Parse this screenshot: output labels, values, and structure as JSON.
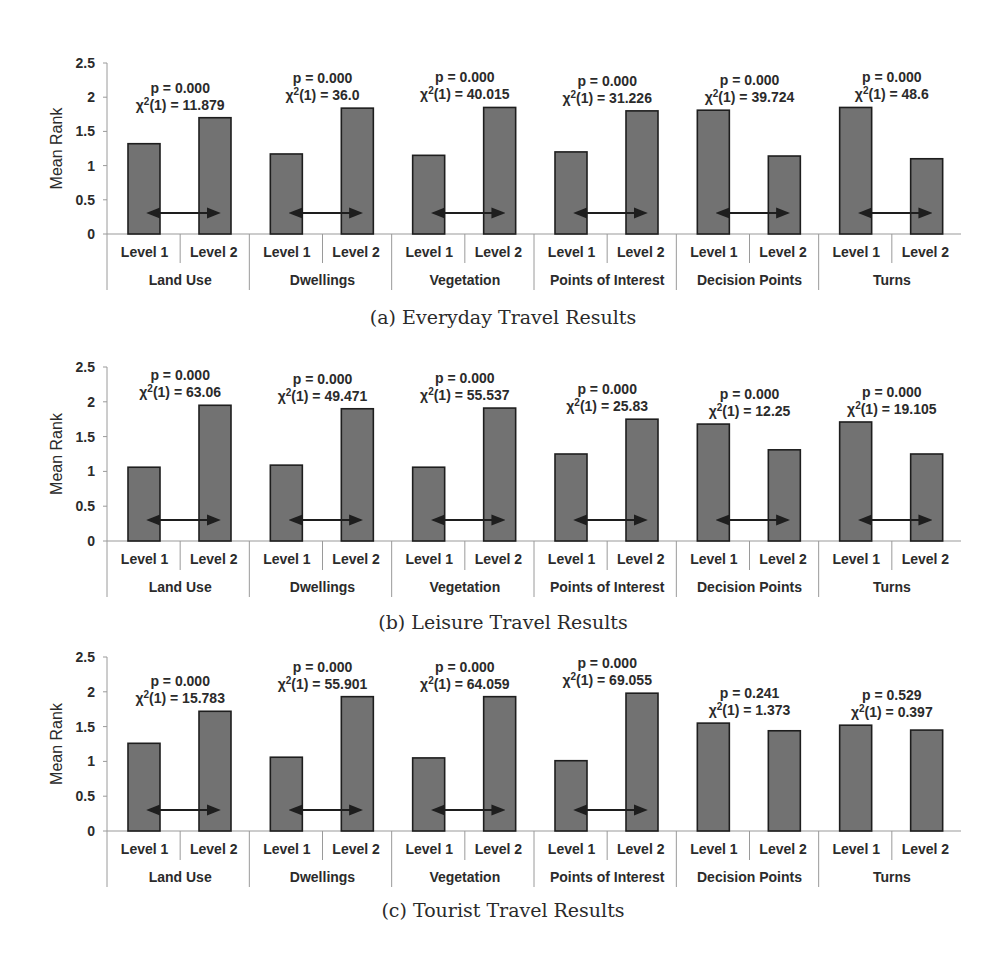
{
  "chart_data": [
    {
      "id": "a",
      "type": "bar",
      "title": "(a) Everyday Travel Results",
      "ylabel": "Mean Rank",
      "ylim": [
        0,
        2.5
      ],
      "yticks": [
        "0",
        "0.5",
        "1",
        "1.5",
        "2",
        "2.5"
      ],
      "grid": false,
      "categories": [
        "Land Use",
        "Dwellings",
        "Vegetation",
        "Points of Interest",
        "Decision Points",
        "Turns"
      ],
      "sub_categories": [
        [
          "Level  1",
          "Level 2"
        ],
        [
          "Level 1",
          "Level 2"
        ],
        [
          "Level 1",
          "Level 2"
        ],
        [
          "Level 1",
          "Level 2"
        ],
        [
          "Level 1",
          "Level 2"
        ],
        [
          "Level 1",
          "Level 2"
        ]
      ],
      "series": [
        {
          "name": "Level 1",
          "values": [
            1.32,
            1.17,
            1.15,
            1.2,
            1.81,
            1.85
          ]
        },
        {
          "name": "Level 2",
          "values": [
            1.7,
            1.84,
            1.85,
            1.8,
            1.14,
            1.1
          ]
        }
      ],
      "annotations": [
        {
          "p": "p = 0.000",
          "chi_prefix": "χ",
          "chi_sup": "2",
          "chi_rest": "(1) = 11.879",
          "significant": true
        },
        {
          "p": "p = 0.000",
          "chi_prefix": "χ",
          "chi_sup": "2",
          "chi_rest": "(1) = 36.0",
          "significant": true
        },
        {
          "p": "p = 0.000",
          "chi_prefix": "χ",
          "chi_sup": "2",
          "chi_rest": "(1) = 40.015",
          "significant": true
        },
        {
          "p": "p = 0.000",
          "chi_prefix": "χ",
          "chi_sup": "2",
          "chi_rest": "(1) = 31.226",
          "significant": true
        },
        {
          "p": "p = 0.000",
          "chi_prefix": "χ",
          "chi_sup": "2",
          "chi_rest": "(1) = 39.724",
          "significant": true
        },
        {
          "p": "p = 0.000",
          "chi_prefix": "χ",
          "chi_sup": "2",
          "chi_rest": "(1) = 48.6",
          "significant": true
        }
      ]
    },
    {
      "id": "b",
      "type": "bar",
      "title": "(b) Leisure Travel Results",
      "ylabel": "Mean Rank",
      "ylim": [
        0,
        2.5
      ],
      "yticks": [
        "0",
        "0.5",
        "1",
        "1.5",
        "2",
        "2.5"
      ],
      "grid": false,
      "categories": [
        "Land Use",
        "Dwellings",
        "Vegetation",
        "Points of Interest",
        "Decision Points",
        "Turns"
      ],
      "sub_categories": [
        [
          "Level  1",
          "Level 2"
        ],
        [
          "Level 1",
          "Level 2"
        ],
        [
          "Level 1",
          "Level 2"
        ],
        [
          "Level 1",
          "Level 2"
        ],
        [
          "Level 1",
          "Level 2"
        ],
        [
          "Level 1",
          "Level 2"
        ]
      ],
      "series": [
        {
          "name": "Level 1",
          "values": [
            1.06,
            1.09,
            1.06,
            1.25,
            1.68,
            1.71
          ]
        },
        {
          "name": "Level 2",
          "values": [
            1.95,
            1.9,
            1.91,
            1.75,
            1.31,
            1.25
          ]
        }
      ],
      "annotations": [
        {
          "p": "p = 0.000",
          "chi_prefix": "χ",
          "chi_sup": "2",
          "chi_rest": "(1) = 63.06",
          "significant": true
        },
        {
          "p": "p = 0.000",
          "chi_prefix": "χ",
          "chi_sup": "2",
          "chi_rest": "(1) = 49.471",
          "significant": true
        },
        {
          "p": "p = 0.000",
          "chi_prefix": "χ",
          "chi_sup": "2",
          "chi_rest": "(1) = 55.537",
          "significant": true
        },
        {
          "p": "p = 0.000",
          "chi_prefix": "χ",
          "chi_sup": "2",
          "chi_rest": "(1) = 25.83",
          "significant": true
        },
        {
          "p": "p = 0.000",
          "chi_prefix": "χ",
          "chi_sup": "2",
          "chi_rest": "(1) = 12.25",
          "significant": true
        },
        {
          "p": "p = 0.000",
          "chi_prefix": "χ",
          "chi_sup": "2",
          "chi_rest": "(1) = 19.105",
          "significant": true
        }
      ]
    },
    {
      "id": "c",
      "type": "bar",
      "title": "(c) Tourist Travel Results",
      "ylabel": "Mean Rank",
      "ylim": [
        0,
        2.5
      ],
      "yticks": [
        "0",
        "0.5",
        "1",
        "1.5",
        "2",
        "2.5"
      ],
      "grid": false,
      "categories": [
        "Land Use",
        "Dwellings",
        "Vegetation",
        "Points of Interest",
        "Decision Points",
        "Turns"
      ],
      "sub_categories": [
        [
          "Level  1",
          "Level 2"
        ],
        [
          "Level 1",
          "Level 2"
        ],
        [
          "Level 1",
          "Level 2"
        ],
        [
          "Level 1",
          "Level 2"
        ],
        [
          "Level 1",
          "Level 2"
        ],
        [
          "Level 1",
          "Level 2"
        ]
      ],
      "series": [
        {
          "name": "Level 1",
          "values": [
            1.26,
            1.06,
            1.05,
            1.01,
            1.55,
            1.52
          ]
        },
        {
          "name": "Level 2",
          "values": [
            1.72,
            1.93,
            1.93,
            1.98,
            1.44,
            1.45
          ]
        }
      ],
      "annotations": [
        {
          "p": "p = 0.000",
          "chi_prefix": "χ",
          "chi_sup": "2",
          "chi_rest": "(1) = 15.783",
          "significant": true
        },
        {
          "p": "p = 0.000",
          "chi_prefix": "χ",
          "chi_sup": "2",
          "chi_rest": "(1) = 55.901",
          "significant": true
        },
        {
          "p": "p = 0.000",
          "chi_prefix": "χ",
          "chi_sup": "2",
          "chi_rest": "(1) = 64.059",
          "significant": true
        },
        {
          "p": "p = 0.000",
          "chi_prefix": "χ",
          "chi_sup": "2",
          "chi_rest": "(1) = 69.055",
          "significant": true
        },
        {
          "p": "p = 0.241",
          "chi_prefix": "χ",
          "chi_sup": "2",
          "chi_rest": "(1) = 1.373",
          "significant": false
        },
        {
          "p": "p = 0.529",
          "chi_prefix": "χ",
          "chi_sup": "2",
          "chi_rest": "(1) = 0.397",
          "significant": false
        }
      ]
    }
  ],
  "style": {
    "bar_fill": "#727272",
    "bar_stroke": "#1e1e1e",
    "axis_color": "#9a9a9a",
    "text_color": "#2b2b2b",
    "arrow_color": "#1e1e1e"
  }
}
